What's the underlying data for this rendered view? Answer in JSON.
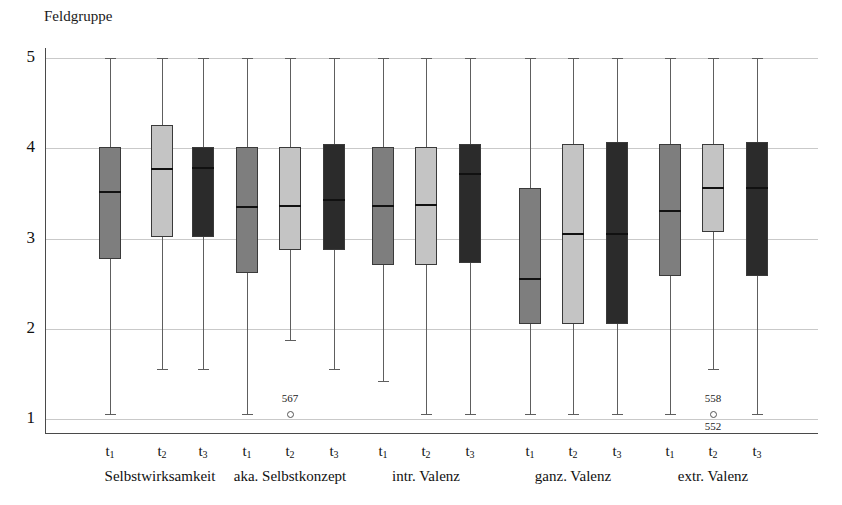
{
  "chart_data": {
    "type": "boxplot",
    "title": "Feldgruppe",
    "xlabel": "",
    "ylabel": "",
    "ylim": [
      1,
      5
    ],
    "y_ticks": [
      1,
      2,
      3,
      4,
      5
    ],
    "y_tick_labels": [
      "1",
      "2",
      "3",
      "4",
      "5"
    ],
    "grid": true,
    "legend": "none",
    "x_tick_labels": [
      "t1",
      "t2",
      "t3",
      "t1",
      "t2",
      "t3",
      "t1",
      "t2",
      "t3",
      "t1",
      "t2",
      "t3",
      "t1",
      "t2",
      "t3"
    ],
    "group_labels": [
      "Selbstwirksamkeit",
      "aka. Selbstkonzept",
      "intr. Valenz",
      "ganz. Valenz",
      "extr. Valenz"
    ],
    "series_names": [
      "t1",
      "t2",
      "t3"
    ],
    "series_colors": [
      "#7e7e7e",
      "#c4c4c4",
      "#2b2b2b"
    ],
    "boxes": [
      {
        "group": "Selbstwirksamkeit",
        "time": "t1",
        "fill": "#7e7e7e",
        "whisker_low": 1.05,
        "q1": 2.77,
        "median": 3.51,
        "q3": 4.01,
        "whisker_high": 5.0
      },
      {
        "group": "Selbstwirksamkeit",
        "time": "t2",
        "fill": "#c4c4c4",
        "whisker_low": 1.55,
        "q1": 3.02,
        "median": 3.77,
        "q3": 4.26,
        "whisker_high": 5.0
      },
      {
        "group": "Selbstwirksamkeit",
        "time": "t3",
        "fill": "#2b2b2b",
        "whisker_low": 1.55,
        "q1": 3.02,
        "median": 3.78,
        "q3": 4.01,
        "whisker_high": 5.0
      },
      {
        "group": "aka. Selbstkonzept",
        "time": "t1",
        "fill": "#7e7e7e",
        "whisker_low": 1.05,
        "q1": 2.62,
        "median": 3.35,
        "q3": 4.01,
        "whisker_high": 5.0
      },
      {
        "group": "aka. Selbstkonzept",
        "time": "t2",
        "fill": "#c4c4c4",
        "whisker_low": 1.88,
        "q1": 2.87,
        "median": 3.36,
        "q3": 4.01,
        "whisker_high": 5.0
      },
      {
        "group": "aka. Selbstkonzept",
        "time": "t3",
        "fill": "#2b2b2b",
        "whisker_low": 1.55,
        "q1": 2.87,
        "median": 3.43,
        "q3": 4.05,
        "whisker_high": 5.0
      },
      {
        "group": "intr. Valenz",
        "time": "t1",
        "fill": "#7e7e7e",
        "whisker_low": 1.42,
        "q1": 2.71,
        "median": 3.36,
        "q3": 4.01,
        "whisker_high": 5.0
      },
      {
        "group": "intr. Valenz",
        "time": "t2",
        "fill": "#c4c4c4",
        "whisker_low": 1.05,
        "q1": 2.71,
        "median": 3.37,
        "q3": 4.01,
        "whisker_high": 5.0
      },
      {
        "group": "intr. Valenz",
        "time": "t3",
        "fill": "#2b2b2b",
        "whisker_low": 1.05,
        "q1": 2.73,
        "median": 3.71,
        "q3": 4.05,
        "whisker_high": 5.0
      },
      {
        "group": "ganz. Valenz",
        "time": "t1",
        "fill": "#7e7e7e",
        "whisker_low": 1.05,
        "q1": 2.05,
        "median": 2.55,
        "q3": 3.56,
        "whisker_high": 5.0
      },
      {
        "group": "ganz. Valenz",
        "time": "t2",
        "fill": "#c4c4c4",
        "whisker_low": 1.05,
        "q1": 2.05,
        "median": 3.05,
        "q3": 4.05,
        "whisker_high": 5.0
      },
      {
        "group": "ganz. Valenz",
        "time": "t3",
        "fill": "#2b2b2b",
        "whisker_low": 1.05,
        "q1": 2.05,
        "median": 3.05,
        "q3": 4.07,
        "whisker_high": 5.0
      },
      {
        "group": "extr. Valenz",
        "time": "t1",
        "fill": "#7e7e7e",
        "whisker_low": 1.05,
        "q1": 2.58,
        "median": 3.31,
        "q3": 4.05,
        "whisker_high": 5.0
      },
      {
        "group": "extr. Valenz",
        "time": "t2",
        "fill": "#c4c4c4",
        "whisker_low": 1.55,
        "q1": 3.07,
        "median": 3.56,
        "q3": 4.05,
        "whisker_high": 5.0
      },
      {
        "group": "extr. Valenz",
        "time": "t3",
        "fill": "#2b2b2b",
        "whisker_low": 1.05,
        "q1": 2.58,
        "median": 3.56,
        "q3": 4.07,
        "whisker_high": 5.0
      }
    ],
    "outliers": [
      {
        "group": "aka. Selbstkonzept",
        "time": "t2",
        "value": 1.05,
        "labels": [
          "567"
        ],
        "label_positions": [
          "above"
        ]
      },
      {
        "group": "extr. Valenz",
        "time": "t2",
        "value": 1.05,
        "labels": [
          "558",
          "552"
        ],
        "label_positions": [
          "above",
          "below"
        ]
      }
    ]
  },
  "geometry": {
    "plot_left": 45,
    "plot_right": 818,
    "y_value_1_px": 419,
    "px_per_unit": 90.25,
    "axis_bottom_px": 433,
    "box_width": 22,
    "box_x_centers": [
      110,
      162,
      203,
      247,
      290,
      334,
      383,
      426,
      470,
      530,
      573,
      617,
      670,
      713,
      757
    ],
    "tick_label_y": 443,
    "group_label_y": 468,
    "group_label_x_centers": [
      160,
      290,
      426,
      573,
      713
    ]
  }
}
